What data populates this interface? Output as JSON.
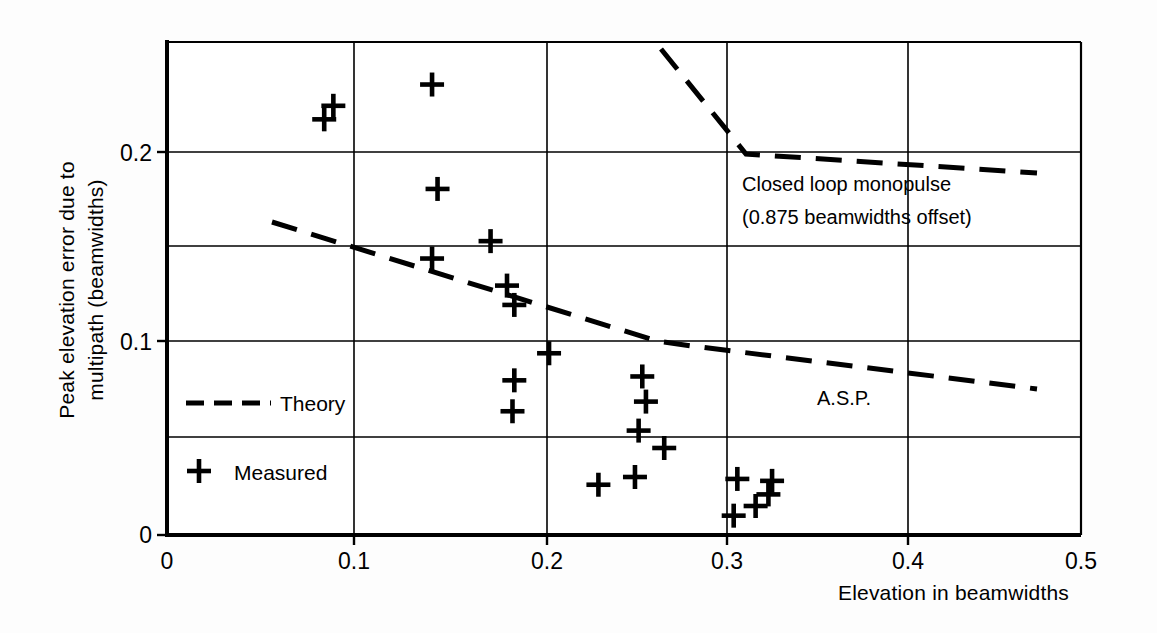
{
  "chart_data": {
    "type": "scatter",
    "title": "",
    "xlabel": "Elevation in beamwidths",
    "ylabel": "Peak elevation error due to multipath  (beamwidths)",
    "ylabel_line1": "Peak elevation error due to",
    "ylabel_line2": "multipath  (beamwidths)",
    "xlim": [
      0,
      0.5
    ],
    "ylim": [
      0,
      0.255
    ],
    "grid": true,
    "x_ticks": [
      0,
      0.1,
      0.2,
      0.3,
      0.4,
      0.5
    ],
    "x_tick_labels": [
      "0",
      "0.1",
      "0.2",
      "0.3",
      "0.4",
      "0.5"
    ],
    "y_ticks": [
      0,
      0.05,
      0.1,
      0.15,
      0.2
    ],
    "y_tick_labels": [
      "0",
      "",
      "0.1",
      "",
      "0.2"
    ],
    "y_gridlines": [
      0.05,
      0.1,
      0.15,
      0.2
    ],
    "legend_position": "inside-lower-left",
    "legend": [
      {
        "key": "theory",
        "label": "Theory",
        "marker": "dashed-line"
      },
      {
        "key": "measured",
        "label": "Measured",
        "marker": "plus"
      }
    ],
    "annotations": [
      {
        "key": "closed-loop-monopulse",
        "line1": "Closed loop monopulse",
        "line2": "(0.875 beamwidths offset)",
        "x": 0.33,
        "y": 0.175
      },
      {
        "key": "asp",
        "line1": "A.S.P.",
        "x": 0.345,
        "y": 0.077
      }
    ],
    "series": [
      {
        "name": "Measured",
        "marker": "plus",
        "points": [
          [
            0.086,
            0.215
          ],
          [
            0.091,
            0.222
          ],
          [
            0.145,
            0.233
          ],
          [
            0.145,
            0.143
          ],
          [
            0.148,
            0.179
          ],
          [
            0.177,
            0.152
          ],
          [
            0.186,
            0.129
          ],
          [
            0.19,
            0.119
          ],
          [
            0.19,
            0.08
          ],
          [
            0.189,
            0.064
          ],
          [
            0.209,
            0.094
          ],
          [
            0.236,
            0.026
          ],
          [
            0.256,
            0.03
          ],
          [
            0.26,
            0.082
          ],
          [
            0.262,
            0.069
          ],
          [
            0.258,
            0.054
          ],
          [
            0.272,
            0.045
          ],
          [
            0.31,
            0.01
          ],
          [
            0.312,
            0.029
          ],
          [
            0.322,
            0.015
          ],
          [
            0.329,
            0.021
          ],
          [
            0.331,
            0.028
          ]
        ]
      }
    ],
    "curves": [
      {
        "name": "Theory (A.S.P.)",
        "style": "dashed",
        "points": [
          [
            0.057,
            0.218
          ],
          [
            0.265,
            0.1
          ],
          [
            0.284,
            0.0975
          ],
          [
            0.47,
            0.073
          ]
        ]
      },
      {
        "name": "Theory (Closed loop monopulse)",
        "style": "dashed",
        "points": [
          [
            0.267,
            0.252
          ],
          [
            0.313,
            0.198
          ],
          [
            0.47,
            0.188
          ]
        ]
      }
    ]
  },
  "axes": {
    "x_title": "Elevation in beamwidths",
    "y_title_line1": "Peak elevation error due to",
    "y_title_line2": "multipath  (beamwidths)"
  },
  "ticks": {
    "x": [
      "0",
      "0.1",
      "0.2",
      "0.3",
      "0.4",
      "0.5"
    ],
    "y_zero": "0",
    "y_01": "0.1",
    "y_02": "0.2"
  },
  "legend": {
    "theory_label": "Theory",
    "measured_label": "Measured"
  },
  "annotations": {
    "closed_loop_line1": "Closed loop monopulse",
    "closed_loop_line2": "(0.875 beamwidths offset)",
    "asp_label": "A.S.P."
  },
  "colors": {
    "ink": "#000000",
    "grid": "#000000",
    "background": "#fdfdfd"
  }
}
